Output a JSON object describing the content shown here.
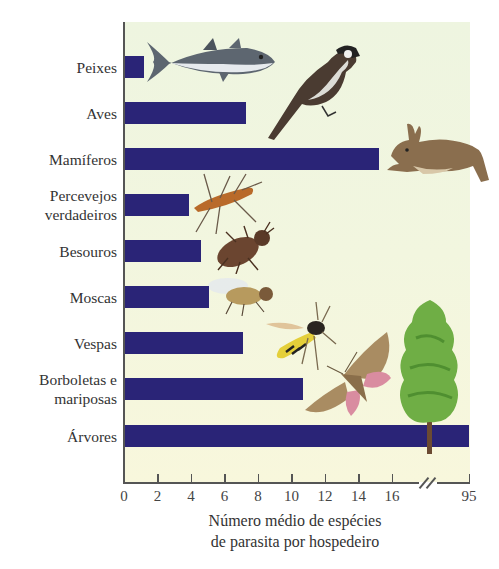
{
  "chart_data": {
    "type": "bar",
    "orientation": "horizontal",
    "title": "",
    "xlabel": "Número médio de espécies de parasita por hospedeiro",
    "xlabel_lines": [
      "Número médio de espécies",
      "de parasita por hospedeiro"
    ],
    "ylabel": "",
    "categories": [
      "Peixes",
      "Aves",
      "Mamíferos",
      "Percevejos verdadeiros",
      "Besouros",
      "Moscas",
      "Vespas",
      "Borboletas e mariposas",
      "Árvores"
    ],
    "category_label_lines": [
      [
        "Peixes"
      ],
      [
        "Aves"
      ],
      [
        "Mamíferos"
      ],
      [
        "Percevejos",
        "verdadeiros"
      ],
      [
        "Besouros"
      ],
      [
        "Moscas"
      ],
      [
        "Vespas"
      ],
      [
        "Borboletas e",
        "mariposas"
      ],
      [
        "Árvores"
      ]
    ],
    "values": [
      1.2,
      7.3,
      15.2,
      3.9,
      4.6,
      5.1,
      7.1,
      10.7,
      95
    ],
    "x_ticks": [
      "0",
      "2",
      "4",
      "6",
      "8",
      "10",
      "12",
      "14",
      "16",
      "95"
    ],
    "x_tick_values": [
      0,
      2,
      4,
      6,
      8,
      10,
      12,
      14,
      16,
      95
    ],
    "xlim": [
      0,
      95
    ],
    "axis_break": {
      "between": [
        16,
        95
      ]
    },
    "grid": false,
    "legend": null,
    "bar_color": "#2a2477",
    "background_color": "#f1f6df",
    "illustrations": [
      "fish (tuna)",
      "bird",
      "rabbit",
      "true bug",
      "beetle",
      "fly",
      "wasp",
      "moth",
      "tree"
    ]
  }
}
